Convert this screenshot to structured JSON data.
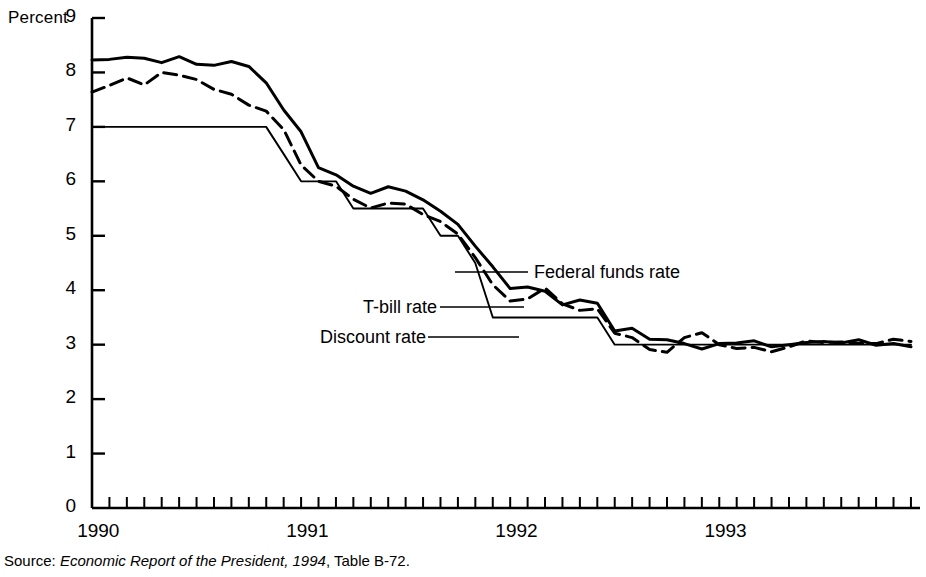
{
  "chart_data": {
    "type": "line",
    "title": "",
    "subtitle": "",
    "ylabel": "Percent",
    "xlabel": "",
    "ylim": [
      0,
      9
    ],
    "xlim": [
      1990.0,
      1993.96
    ],
    "ytick_labels": [
      "0",
      "1",
      "2",
      "3",
      "4",
      "5",
      "6",
      "7",
      "8",
      "9"
    ],
    "ytick_values": [
      0,
      1,
      2,
      3,
      4,
      5,
      6,
      7,
      8,
      9
    ],
    "xtick_labels": [
      "1990",
      "1991",
      "1992",
      "1993"
    ],
    "xtick_values": [
      1990,
      1991,
      1992,
      1993
    ],
    "x_minor_ticks": "monthly",
    "grid": false,
    "legend_position": "inline-annotations",
    "x": [
      1990.0,
      1990.083,
      1990.167,
      1990.25,
      1990.333,
      1990.417,
      1990.5,
      1990.583,
      1990.667,
      1990.75,
      1990.833,
      1990.917,
      1991.0,
      1991.083,
      1991.167,
      1991.25,
      1991.333,
      1991.417,
      1991.5,
      1991.583,
      1991.667,
      1991.75,
      1991.833,
      1991.917,
      1992.0,
      1992.083,
      1992.167,
      1992.25,
      1992.333,
      1992.417,
      1992.5,
      1992.583,
      1992.667,
      1992.75,
      1992.833,
      1992.917,
      1993.0,
      1993.083,
      1993.167,
      1993.25,
      1993.333,
      1993.417,
      1993.5,
      1993.583,
      1993.667,
      1993.75,
      1993.833,
      1993.917
    ],
    "series": [
      {
        "name": "Federal funds rate",
        "style": "solid",
        "values": [
          8.23,
          8.24,
          8.28,
          8.26,
          8.18,
          8.29,
          8.15,
          8.13,
          8.2,
          8.11,
          7.81,
          7.31,
          6.91,
          6.25,
          6.12,
          5.91,
          5.78,
          5.9,
          5.82,
          5.66,
          5.45,
          5.21,
          4.81,
          4.43,
          4.03,
          4.06,
          3.98,
          3.73,
          3.82,
          3.76,
          3.25,
          3.3,
          3.1,
          3.09,
          3.02,
          2.92,
          3.02,
          3.03,
          3.07,
          2.96,
          3.0,
          3.04,
          3.06,
          3.03,
          3.09,
          2.99,
          3.02,
          2.96
        ]
      },
      {
        "name": "T-bill rate",
        "style": "dashed",
        "values": [
          7.64,
          7.76,
          7.9,
          7.77,
          8.0,
          7.95,
          7.87,
          7.69,
          7.6,
          7.4,
          7.29,
          6.95,
          6.3,
          6.0,
          5.91,
          5.67,
          5.51,
          5.6,
          5.58,
          5.39,
          5.26,
          5.03,
          4.6,
          4.1,
          3.8,
          3.84,
          4.04,
          3.75,
          3.63,
          3.66,
          3.21,
          3.13,
          2.91,
          2.86,
          3.13,
          3.22,
          3.0,
          2.93,
          2.95,
          2.87,
          2.96,
          3.07,
          3.04,
          3.05,
          3.02,
          3.02,
          3.1,
          3.06
        ]
      },
      {
        "name": "Discount rate",
        "style": "solid-thin",
        "values": [
          7.0,
          7.0,
          7.0,
          7.0,
          7.0,
          7.0,
          7.0,
          7.0,
          7.0,
          7.0,
          7.0,
          6.5,
          6.0,
          6.0,
          6.0,
          5.5,
          5.5,
          5.5,
          5.5,
          5.5,
          5.0,
          5.0,
          4.5,
          3.5,
          3.5,
          3.5,
          3.5,
          3.5,
          3.5,
          3.5,
          3.0,
          3.0,
          3.0,
          3.0,
          3.0,
          3.0,
          3.0,
          3.0,
          3.0,
          3.0,
          3.0,
          3.0,
          3.0,
          3.0,
          3.0,
          3.0,
          3.0,
          3.0
        ]
      }
    ]
  },
  "annotations": {
    "federal_funds": "Federal funds rate",
    "tbill": "T-bill rate",
    "discount": "Discount rate"
  },
  "source": {
    "prefix": "Source:",
    "publication": "Economic Report of the President, 1994",
    "suffix": "Table B-72."
  },
  "colors": {
    "line": "#000000",
    "axis": "#000000",
    "background": "#ffffff"
  }
}
